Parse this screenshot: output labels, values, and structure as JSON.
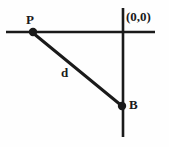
{
  "figure": {
    "background_color": "#fefefe",
    "stroke_color": "#1a1a1a",
    "labels": {
      "point_p": "P",
      "point_b": "B",
      "segment_d": "d",
      "origin": "(0,0)"
    },
    "axes": {
      "horizontal": {
        "name": "horizontal-axis",
        "x1": 6,
        "y1": 32,
        "x2": 155,
        "y2": 32,
        "stroke_width": 2.6
      },
      "vertical": {
        "name": "vertical-axis",
        "x1": 123,
        "y1": 8,
        "x2": 123,
        "y2": 137,
        "stroke_width": 2.6
      }
    },
    "segment": {
      "name": "segment-PB",
      "label": "d",
      "x1": 33,
      "y1": 33,
      "x2": 122,
      "y2": 106,
      "stroke_width": 3.0
    },
    "points": [
      {
        "name": "P",
        "x": 33,
        "y": 32,
        "radius": 4.2
      },
      {
        "name": "B",
        "x": 122,
        "y": 106,
        "radius": 4.2
      }
    ]
  }
}
